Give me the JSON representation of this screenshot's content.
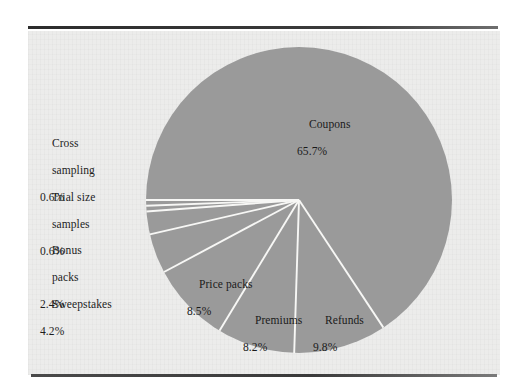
{
  "figure": {
    "background_color": "#ffffff",
    "panel_color": "#ececeb",
    "rule_color": "#3a3a3a"
  },
  "chart_data": {
    "type": "pie",
    "title": "",
    "subtitle": "",
    "xlabel": "",
    "ylabel": "",
    "legend_position": "none",
    "grid": false,
    "slice_fill_color": "#9a9a9a",
    "slice_separator_color": "#f7f7f5",
    "units": "percent",
    "total": 100.0,
    "start_angle_deg": 180,
    "direction": "clockwise",
    "categories": [
      "Coupons",
      "Refunds",
      "Premiums",
      "Price packs",
      "Sweepstakes",
      "Bonus packs",
      "Trial size samples",
      "Cross sampling"
    ],
    "values": [
      65.7,
      9.8,
      8.2,
      8.5,
      4.2,
      2.4,
      0.6,
      0.6
    ],
    "slices": [
      {
        "label": "Coupons",
        "value": 65.7,
        "value_text": "65.7%",
        "label_placement": "inside"
      },
      {
        "label": "Refunds",
        "value": 9.8,
        "value_text": "9.8%",
        "label_placement": "inside"
      },
      {
        "label": "Premiums",
        "value": 8.2,
        "value_text": "8.2%",
        "label_placement": "inside"
      },
      {
        "label": "Price packs",
        "value": 8.5,
        "value_text": "8.5%",
        "label_placement": "inside"
      },
      {
        "label": "Sweepstakes",
        "value": 4.2,
        "value_text": "4.2%",
        "label_placement": "outside-left"
      },
      {
        "label": "Bonus packs",
        "value": 2.4,
        "value_text": "2.4%",
        "label_placement": "outside-left"
      },
      {
        "label": "Trial size samples",
        "value": 0.6,
        "value_text": "0.6%",
        "label_placement": "outside-left"
      },
      {
        "label": "Cross sampling",
        "value": 0.6,
        "value_text": "0.6%",
        "label_placement": "outside-left"
      }
    ]
  },
  "labels": {
    "cross_sampling": {
      "line1": "Cross",
      "line2": "sampling",
      "pct": "0.6%"
    },
    "trial_size": {
      "line1": "Trial size",
      "line2": "samples",
      "pct": "0.6%"
    },
    "bonus_packs": {
      "line1": "Bonus",
      "line2": "packs",
      "pct": "2.4%"
    },
    "sweepstakes": {
      "line1": "Sweepstakes",
      "line2": "",
      "pct": "4.2%"
    },
    "coupons": {
      "line1": "Coupons",
      "line2": "",
      "pct": "65.7%"
    },
    "price_packs": {
      "line1": "Price packs",
      "line2": "",
      "pct": "8.5%"
    },
    "premiums": {
      "line1": "Premiums",
      "line2": "",
      "pct": "8.2%"
    },
    "refunds": {
      "line1": "Refunds",
      "line2": "",
      "pct": "9.8%"
    }
  }
}
